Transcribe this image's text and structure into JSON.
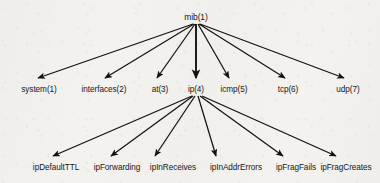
{
  "diagram": {
    "background_color": "#f4f2ef",
    "line_color": "#121212",
    "text_color": "#161616",
    "root": {
      "label": "mib(1)",
      "x": 196,
      "y": 20
    },
    "level1": [
      {
        "label": "system(1)",
        "x": 39,
        "y": 92,
        "arrow_x": 36,
        "arrow_y": 81
      },
      {
        "label": "interfaces(2)",
        "x": 104,
        "y": 92,
        "arrow_x": 104,
        "arrow_y": 81
      },
      {
        "label": "at(3)",
        "x": 160,
        "y": 92,
        "arrow_x": 156,
        "arrow_y": 81
      },
      {
        "label": "ip(4)",
        "x": 196,
        "y": 92,
        "arrow_x": 196,
        "arrow_y": 81
      },
      {
        "label": "icmp(5)",
        "x": 234,
        "y": 92,
        "arrow_x": 229,
        "arrow_y": 81
      },
      {
        "label": "tcp(6)",
        "x": 288,
        "y": 92,
        "arrow_x": 285,
        "arrow_y": 81
      },
      {
        "label": "udp(7)",
        "x": 348,
        "y": 92,
        "arrow_x": 345,
        "arrow_y": 81
      }
    ],
    "level2_parent": "ip(4)",
    "level2": [
      {
        "label": "ipDefaultTTL",
        "x": 56,
        "y": 170,
        "arrow_x": 51,
        "arrow_y": 159
      },
      {
        "label": "ipForwarding",
        "x": 117,
        "y": 170,
        "arrow_x": 110,
        "arrow_y": 159
      },
      {
        "label": "ipInReceives",
        "x": 173,
        "y": 170,
        "arrow_x": 154,
        "arrow_y": 159
      },
      {
        "label": "ipInAddrErrors",
        "x": 236,
        "y": 170,
        "arrow_x": 216,
        "arrow_y": 159
      },
      {
        "label": "ipFragFails",
        "x": 296,
        "y": 170,
        "arrow_x": 284,
        "arrow_y": 159
      },
      {
        "label": "ipFragCreates",
        "x": 346,
        "y": 170,
        "arrow_x": 337,
        "arrow_y": 159
      }
    ],
    "edges_from_root": 7,
    "edges_from_ip": 6
  }
}
